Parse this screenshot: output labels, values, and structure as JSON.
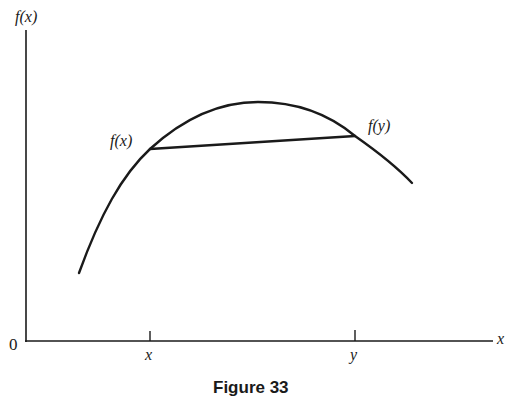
{
  "figure": {
    "caption": "Figure 33",
    "axes": {
      "y_label": "f(x)",
      "x_label": "x",
      "origin_label": "0"
    },
    "ticks": [
      {
        "label": "x",
        "px": 150
      },
      {
        "label": "y",
        "px": 355
      }
    ],
    "curve": {
      "description": "concave function",
      "start": [
        79,
        273
      ],
      "peak": [
        258,
        102
      ],
      "end": [
        412,
        183
      ]
    },
    "chord": {
      "from_label": "f(x)",
      "to_label": "f(y)",
      "from": [
        150,
        149
      ],
      "to": [
        355,
        136
      ]
    },
    "colors": {
      "ink": "#1a1a1a",
      "background": "#ffffff"
    }
  }
}
